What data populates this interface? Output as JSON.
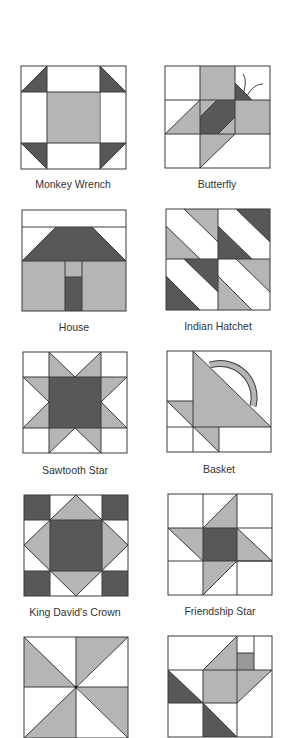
{
  "colors": {
    "light": "#b5b5b5",
    "dark": "#585858",
    "white": "#ffffff",
    "outline": "#3a3a3a",
    "label": "#333333"
  },
  "blocks": [
    {
      "name": "Monkey Wrench",
      "row": 0,
      "col": 0
    },
    {
      "name": "Butterfly",
      "row": 0,
      "col": 1
    },
    {
      "name": "House",
      "row": 1,
      "col": 0
    },
    {
      "name": "Indian Hatchet",
      "row": 1,
      "col": 1
    },
    {
      "name": "Sawtooth Star",
      "row": 2,
      "col": 0
    },
    {
      "name": "Basket",
      "row": 2,
      "col": 1
    },
    {
      "name": "King David's Crown",
      "row": 3,
      "col": 0
    },
    {
      "name": "Friendship Star",
      "row": 3,
      "col": 1
    },
    {
      "name": "Pinwheel",
      "row": 4,
      "col": 0,
      "label_visible": false
    },
    {
      "name": "Flying Bird",
      "row": 4,
      "col": 1,
      "label_visible": false
    }
  ]
}
